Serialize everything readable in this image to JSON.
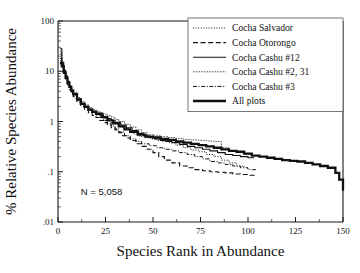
{
  "chart_data": {
    "type": "line",
    "title": "",
    "xlabel": "Species Rank in Abundance",
    "ylabel": "% Relative Species Abundance",
    "xlim": [
      0,
      150
    ],
    "ylim": [
      0.01,
      100
    ],
    "yscale": "log",
    "xscale": "linear",
    "grid": false,
    "xticks": [
      0,
      25,
      50,
      75,
      100,
      125,
      150
    ],
    "xtick_labels": [
      "0",
      "25",
      "50",
      "75",
      "100",
      "125",
      "150"
    ],
    "yticks": [
      100,
      10,
      1,
      0.1,
      0.01
    ],
    "ytick_labels": [
      "100",
      "10",
      "1",
      ".1",
      ".01"
    ],
    "annotations": [
      {
        "name": "sample-size",
        "text": "N  =  5,058",
        "x": 12,
        "y": 0.035
      }
    ],
    "legend": {
      "position": "top-right",
      "entries": [
        {
          "label": "Cocha Salvador",
          "style": "dotted",
          "width": 1.0
        },
        {
          "label": "Cocha Otorongo",
          "style": "dashed",
          "width": 1.1
        },
        {
          "label": "Cocha Cashu  #12",
          "style": "solid",
          "width": 1.1
        },
        {
          "label": "Cocha Cashu #2, 31",
          "style": "fine",
          "width": 0.7
        },
        {
          "label": "Cocha Cashu #3",
          "style": "dashdot",
          "width": 1.0
        },
        {
          "label": "All plots",
          "style": "thick",
          "width": 2.3
        }
      ]
    },
    "series": [
      {
        "name": "Cocha Salvador",
        "style": "dotted",
        "width": 1.0,
        "x": [
          1,
          2,
          3,
          4,
          5,
          6,
          7,
          8,
          10,
          12,
          14,
          16,
          18,
          20,
          22,
          24,
          26,
          28,
          30,
          32,
          34,
          36,
          38,
          40,
          43,
          46,
          49,
          52,
          55,
          58,
          62,
          66,
          70,
          74,
          78,
          82,
          86,
          90,
          94,
          98
        ],
        "y": [
          22,
          14,
          10,
          7.5,
          6.0,
          4.6,
          3.9,
          3.3,
          2.6,
          2.2,
          1.9,
          1.7,
          1.55,
          1.42,
          1.3,
          1.15,
          1.05,
          0.95,
          0.9,
          0.82,
          0.75,
          0.7,
          0.62,
          0.56,
          0.5,
          0.47,
          0.45,
          0.42,
          0.4,
          0.38,
          0.34,
          0.3,
          0.27,
          0.25,
          0.22,
          0.2,
          0.17,
          0.15,
          0.13,
          0.12
        ]
      },
      {
        "name": "Cocha Otorongo",
        "style": "dashed",
        "width": 1.1,
        "x": [
          1,
          2,
          3,
          4,
          5,
          6,
          7,
          8,
          10,
          12,
          14,
          16,
          18,
          20,
          22,
          24,
          26,
          28,
          30,
          32,
          34,
          36,
          38,
          41,
          44,
          47,
          50,
          53,
          56,
          60,
          64,
          68,
          72,
          76,
          80,
          84,
          88,
          92,
          96,
          100,
          104
        ],
        "y": [
          16,
          13,
          9.0,
          7.0,
          5.4,
          4.3,
          3.6,
          3.1,
          2.4,
          2.0,
          1.7,
          1.5,
          1.32,
          1.2,
          1.05,
          0.95,
          0.85,
          0.75,
          0.68,
          0.6,
          0.52,
          0.47,
          0.42,
          0.36,
          0.32,
          0.28,
          0.24,
          0.2,
          0.17,
          0.15,
          0.13,
          0.12,
          0.11,
          0.105,
          0.1,
          0.098,
          0.095,
          0.09,
          0.088,
          0.085,
          0.082
        ]
      },
      {
        "name": "Cocha Cashu  #12",
        "style": "solid",
        "width": 1.1,
        "x": [
          1,
          2,
          3,
          4,
          5,
          6,
          7,
          8,
          10,
          12,
          14,
          16,
          18,
          20,
          22,
          24,
          26,
          28,
          30,
          33,
          36,
          39,
          42,
          45,
          48,
          51,
          54,
          57,
          60,
          64,
          68,
          72,
          76,
          80,
          84,
          88,
          92,
          96,
          100,
          103
        ],
        "y": [
          28,
          15,
          10.5,
          8.0,
          6.2,
          5.0,
          4.2,
          3.5,
          2.8,
          2.3,
          2.0,
          1.75,
          1.6,
          1.48,
          1.36,
          1.25,
          1.14,
          1.05,
          0.96,
          0.85,
          0.75,
          0.66,
          0.58,
          0.52,
          0.48,
          0.45,
          0.42,
          0.4,
          0.38,
          0.35,
          0.32,
          0.3,
          0.28,
          0.26,
          0.24,
          0.22,
          0.21,
          0.2,
          0.19,
          0.185
        ]
      },
      {
        "name": "Cocha Cashu #2, 31",
        "style": "fine",
        "width": 0.7,
        "x": [
          1,
          2,
          3,
          4,
          5,
          6,
          7,
          8,
          10,
          12,
          14,
          16,
          18,
          20,
          22,
          24,
          26,
          28,
          30,
          32,
          35,
          38,
          41,
          44,
          47,
          50,
          54,
          58,
          62,
          66,
          70,
          74,
          78,
          82,
          86,
          90,
          94,
          98,
          102
        ],
        "y": [
          25,
          14.5,
          10.0,
          7.8,
          6.4,
          5.2,
          4.4,
          3.8,
          3.0,
          2.5,
          2.15,
          1.9,
          1.72,
          1.6,
          1.5,
          1.4,
          1.32,
          1.22,
          1.1,
          1.0,
          0.88,
          0.78,
          0.68,
          0.6,
          0.55,
          0.52,
          0.5,
          0.48,
          0.46,
          0.44,
          0.43,
          0.42,
          0.41,
          0.4,
          0.3,
          0.26,
          0.24,
          0.22,
          0.2
        ]
      },
      {
        "name": "Cocha Cashu #3",
        "style": "dashdot",
        "width": 1.0,
        "x": [
          1,
          2,
          3,
          4,
          5,
          6,
          7,
          8,
          10,
          12,
          14,
          16,
          18,
          20,
          22,
          24,
          26,
          28,
          30,
          32,
          35,
          38,
          41,
          44,
          48,
          52,
          56,
          60,
          64,
          68,
          72,
          76,
          80,
          84,
          88,
          92,
          96,
          100,
          104
        ],
        "y": [
          18,
          13,
          9.5,
          7.2,
          5.8,
          4.8,
          4.0,
          3.4,
          2.7,
          2.25,
          1.95,
          1.7,
          1.5,
          1.35,
          1.2,
          1.05,
          0.92,
          0.82,
          0.72,
          0.62,
          0.52,
          0.45,
          0.4,
          0.36,
          0.33,
          0.3,
          0.28,
          0.26,
          0.24,
          0.22,
          0.2,
          0.18,
          0.16,
          0.15,
          0.14,
          0.13,
          0.12,
          0.11,
          0.1
        ]
      },
      {
        "name": "All plots",
        "style": "thick",
        "width": 2.3,
        "x": [
          1,
          2,
          3,
          4,
          5,
          6,
          7,
          8,
          10,
          12,
          14,
          16,
          18,
          20,
          23,
          26,
          29,
          32,
          35,
          38,
          42,
          46,
          50,
          54,
          58,
          62,
          66,
          70,
          74,
          78,
          82,
          86,
          90,
          94,
          98,
          102,
          106,
          110,
          114,
          118,
          122,
          126,
          130,
          134,
          138,
          142,
          146,
          148,
          150
        ],
        "y": [
          14.5,
          12.5,
          9.5,
          7.4,
          5.9,
          4.9,
          4.1,
          3.5,
          2.75,
          2.25,
          1.95,
          1.72,
          1.55,
          1.42,
          1.22,
          1.05,
          0.92,
          0.8,
          0.7,
          0.62,
          0.55,
          0.5,
          0.48,
          0.45,
          0.43,
          0.4,
          0.38,
          0.36,
          0.34,
          0.32,
          0.3,
          0.28,
          0.26,
          0.25,
          0.23,
          0.21,
          0.2,
          0.19,
          0.18,
          0.17,
          0.165,
          0.16,
          0.15,
          0.14,
          0.13,
          0.12,
          0.095,
          0.07,
          0.042
        ]
      }
    ]
  }
}
